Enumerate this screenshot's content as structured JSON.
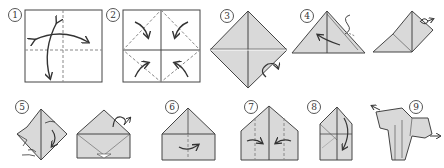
{
  "diagram": {
    "type": "origami-instructions",
    "colors": {
      "paper_fill": "#d9d9d9",
      "line": "#444444",
      "crease": "#888888",
      "background": "#ffffff"
    },
    "steps": [
      {
        "id": "1",
        "label": "1",
        "shape": "square",
        "description": "square with valley fold crease lines and two curved fold arrows"
      },
      {
        "id": "2",
        "label": "2",
        "shape": "square-with-diagonals",
        "description": "fold four corners to center"
      },
      {
        "id": "3",
        "label": "3",
        "shape": "diamond",
        "description": "folded diamond, turn over arrow"
      },
      {
        "id": "4",
        "label": "4",
        "shape": "triangle",
        "description": "fold triangle with arrow"
      },
      {
        "id": "4b",
        "label": "",
        "shape": "triangle-flap",
        "description": "intermediate, turn over arrow"
      },
      {
        "id": "5",
        "label": "5",
        "shape": "squash",
        "description": "squash fold"
      },
      {
        "id": "5b",
        "label": "",
        "shape": "house",
        "description": "intermediate, turn over arrow"
      },
      {
        "id": "6",
        "label": "6",
        "shape": "house",
        "description": "fold with arrow"
      },
      {
        "id": "7",
        "label": "7",
        "shape": "house",
        "description": "fold sides inward"
      },
      {
        "id": "8",
        "label": "8",
        "shape": "narrow-house",
        "description": "fold down"
      },
      {
        "id": "9",
        "label": "9",
        "shape": "dog",
        "description": "finished model"
      }
    ]
  }
}
